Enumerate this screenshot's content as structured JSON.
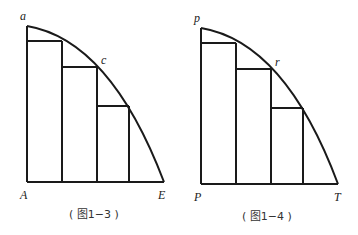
{
  "figures": [
    {
      "caption": "( 图1−3 )",
      "labels": {
        "top": "a",
        "mid": "c",
        "origin": "A",
        "end": "E"
      }
    },
    {
      "caption": "( 图1−4 )",
      "labels": {
        "top": "p",
        "mid": "r",
        "origin": "P",
        "end": "T"
      }
    }
  ],
  "colors": {
    "stroke": "#1a1a1a",
    "background": "#ffffff"
  }
}
